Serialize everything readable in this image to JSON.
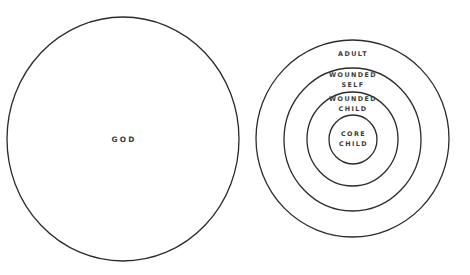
{
  "diagram": {
    "type": "concentric-circles",
    "colors": {
      "background": "#ffffff",
      "stroke": "#2b2b2b",
      "text": "#3a3a3a"
    },
    "left": {
      "label": "GOD"
    },
    "right": {
      "rings": [
        {
          "id": "adult",
          "lines": [
            "ADULT"
          ]
        },
        {
          "id": "wounded-self",
          "lines": [
            "WOUNDED",
            "SELF"
          ]
        },
        {
          "id": "wounded-child",
          "lines": [
            "WOUNDED",
            "CHILD"
          ]
        },
        {
          "id": "core-child",
          "lines": [
            "CORE",
            "CHILD"
          ]
        }
      ]
    }
  }
}
